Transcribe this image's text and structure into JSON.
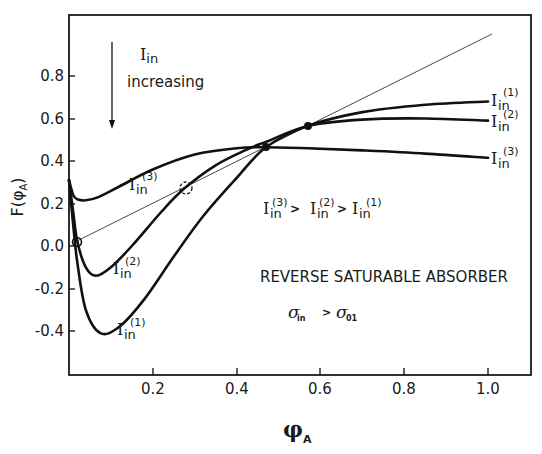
{
  "chart_data": {
    "type": "line",
    "title": "",
    "xlabel": "φA",
    "ylabel": "F(φA)",
    "xlim": [
      0.0,
      1.1
    ],
    "ylim": [
      -0.55,
      1.0
    ],
    "x_ticks": [
      "0.2",
      "0.4",
      "0.6",
      "0.8",
      "1.0"
    ],
    "x_tick_values": [
      0.2,
      0.4,
      0.6,
      0.8,
      1.0
    ],
    "y_ticks": [
      "0.8",
      "0.6",
      "0.4",
      "0.2",
      "0.0",
      "-0.2",
      "-0.4"
    ],
    "y_tick_values": [
      0.8,
      0.6,
      0.4,
      0.2,
      0.0,
      -0.2,
      -0.4
    ],
    "grid": false,
    "series": [
      {
        "name": "Iin(1)",
        "label_main": "I",
        "label_sub": "in",
        "label_sup": "(1)",
        "x": [
          0.0,
          0.01,
          0.02,
          0.04,
          0.075,
          0.12,
          0.18,
          0.25,
          0.32,
          0.4,
          0.47,
          0.57,
          0.7,
          0.85,
          1.0
        ],
        "y": [
          0.31,
          0.1,
          -0.08,
          -0.3,
          -0.41,
          -0.38,
          -0.25,
          -0.05,
          0.14,
          0.32,
          0.465,
          0.565,
          0.63,
          0.665,
          0.68
        ]
      },
      {
        "name": "Iin(2)",
        "label_main": "I",
        "label_sub": "in",
        "label_sup": "(2)",
        "x": [
          0.0,
          0.01,
          0.02,
          0.04,
          0.065,
          0.1,
          0.15,
          0.22,
          0.275,
          0.35,
          0.42,
          0.47,
          0.57,
          0.7,
          0.85,
          1.0
        ],
        "y": [
          0.31,
          0.16,
          0.02,
          -0.1,
          -0.14,
          -0.1,
          0.0,
          0.16,
          0.27,
          0.38,
          0.45,
          0.49,
          0.565,
          0.595,
          0.6,
          0.59
        ]
      },
      {
        "name": "Iin(3)",
        "label_main": "I",
        "label_sub": "in",
        "label_sup": "(3)",
        "x": [
          0.0,
          0.01,
          0.02,
          0.04,
          0.07,
          0.12,
          0.2,
          0.3,
          0.4,
          0.47,
          0.57,
          0.7,
          0.85,
          1.0
        ],
        "y": [
          0.31,
          0.24,
          0.22,
          0.215,
          0.23,
          0.28,
          0.36,
          0.43,
          0.46,
          0.465,
          0.46,
          0.45,
          0.435,
          0.415
        ]
      },
      {
        "name": "diagonal F=φA",
        "x": [
          0.02,
          1.01
        ],
        "y": [
          0.02,
          1.0
        ]
      }
    ],
    "markers": [
      {
        "type": "filled-dot",
        "x": 0.47,
        "y": 0.465
      },
      {
        "type": "filled-dot",
        "x": 0.57,
        "y": 0.565
      },
      {
        "type": "open-circle-dashed",
        "x": 0.275,
        "y": 0.275
      },
      {
        "type": "open-circle",
        "x": 0.02,
        "y": 0.02
      }
    ],
    "annotations": [
      {
        "text": "Iin increasing",
        "with_down_arrow": true
      },
      {
        "text": "Iin(3) > Iin(2) > Iin(1)"
      },
      {
        "text": "REVERSE SATURABLE ABSORBER"
      },
      {
        "text": "σin > σ01"
      }
    ]
  },
  "labels": {
    "x_axis": {
      "main": "φ",
      "sub": "A"
    },
    "y_axis": "F(φ",
    "y_axis_sub": "A",
    "y_axis_close": ")",
    "arrow_label_main": "I",
    "arrow_label_sub": "in",
    "arrow_label_line2": "increasing",
    "order_I": "I",
    "order_sub": "in",
    "order_sup1": "(3)",
    "order_sup2": "(2)",
    "order_sup3": "(1)",
    "order_gt": ">",
    "rsa": "REVERSE SATURABLE ABSORBER",
    "sigma": "σ",
    "sigma_sub1": "in",
    "sigma_gt": ">",
    "sigma_sub2": "01",
    "curve_I": "I",
    "curve_sub": "in",
    "curve_sup1": "(1)",
    "curve_sup2": "(2)",
    "curve_sup3": "(3)"
  }
}
